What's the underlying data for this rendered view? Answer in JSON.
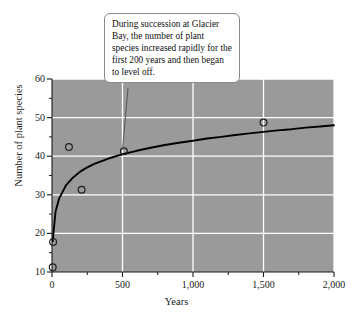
{
  "chart_data": {
    "type": "scatter",
    "title": "",
    "subtitle": "",
    "xlabel": "Years",
    "ylabel": "Number of plant species",
    "xlim": [
      0,
      2000
    ],
    "ylim": [
      10,
      60
    ],
    "grid": true,
    "legend": null,
    "plot_background": "#9a9a9a",
    "gridline_color": "#ffffff",
    "marker_style": "open-circle",
    "x_ticks": [
      0,
      500,
      1000,
      1500,
      2000
    ],
    "x_tick_labels": [
      "0",
      "500",
      "1,000",
      "1,500",
      "2,000"
    ],
    "x_minor_ticks": [
      250,
      750,
      1250,
      1750
    ],
    "y_ticks": [
      10,
      20,
      30,
      40,
      50,
      60
    ],
    "y_tick_labels": [
      "10",
      "20",
      "30",
      "40",
      "50",
      "60"
    ],
    "y_minor_ticks": [
      15,
      25,
      35,
      45,
      55
    ],
    "points": [
      {
        "x": 5,
        "y": 11.2
      },
      {
        "x": 8,
        "y": 17.8
      },
      {
        "x": 120,
        "y": 42.4
      },
      {
        "x": 210,
        "y": 31.3
      },
      {
        "x": 510,
        "y": 41.3
      },
      {
        "x": 1500,
        "y": 48.7
      }
    ],
    "series": [
      {
        "name": "fitted curve",
        "type": "line",
        "color": "#000000",
        "description": "logarithmic best-fit curve rising steeply then leveling off",
        "x": [
          5,
          25,
          50,
          100,
          150,
          200,
          250,
          300,
          400,
          500,
          600,
          700,
          800,
          900,
          1000,
          1100,
          1200,
          1300,
          1400,
          1500,
          1600,
          1700,
          1800,
          1900,
          2000
        ],
        "y": [
          18.0,
          25.6,
          29.0,
          32.5,
          34.5,
          36.0,
          37.1,
          38.0,
          39.4,
          40.5,
          41.4,
          42.2,
          42.9,
          43.5,
          44.0,
          44.6,
          45.0,
          45.5,
          45.9,
          46.3,
          46.7,
          47.0,
          47.4,
          47.7,
          48.0
        ]
      }
    ],
    "annotations": [
      {
        "name": "callout",
        "text": "During succession at Glacier Bay, the number of plant species increased rapidly for the first 200 years and then began to level off.",
        "target_point": {
          "x": 510,
          "y": 41.3
        }
      }
    ]
  },
  "callout": {
    "text": "During succession at Glacier Bay, the number of plant species increased rapidly for the first 200 years and then began to level off."
  },
  "axes": {
    "xlabel": "Years",
    "ylabel": "Number of plant species"
  }
}
